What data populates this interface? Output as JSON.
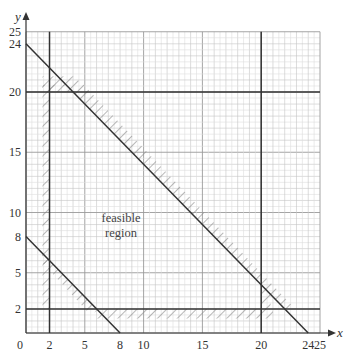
{
  "chart_data": {
    "type": "line",
    "title": "",
    "xlabel": "x",
    "ylabel": "y",
    "xlim": [
      0,
      25
    ],
    "ylim": [
      0,
      25
    ],
    "grid": true,
    "x_ticks": [
      0,
      2,
      5,
      8,
      10,
      15,
      20,
      24,
      25
    ],
    "y_ticks": [
      2,
      5,
      8,
      10,
      15,
      20,
      24,
      25
    ],
    "series": [
      {
        "name": "x + y = 24",
        "points": [
          [
            0,
            24
          ],
          [
            24,
            0
          ]
        ],
        "hatched_side": "above-right"
      },
      {
        "name": "x + y = 8",
        "points": [
          [
            0,
            8
          ],
          [
            8,
            0
          ]
        ],
        "hatched_side": "below-left"
      },
      {
        "name": "x = 2",
        "points": [
          [
            2,
            0
          ],
          [
            2,
            25
          ]
        ],
        "hatched_side": "left"
      },
      {
        "name": "x = 20",
        "points": [
          [
            20,
            0
          ],
          [
            20,
            25
          ]
        ],
        "hatched_side": "right"
      },
      {
        "name": "y = 2",
        "points": [
          [
            0,
            2
          ],
          [
            25,
            2
          ]
        ],
        "hatched_side": "below"
      },
      {
        "name": "y = 20",
        "points": [
          [
            0,
            20
          ],
          [
            25,
            20
          ]
        ],
        "hatched_side": "above"
      }
    ],
    "annotations": [
      {
        "text": "feasible region",
        "x": 8,
        "y": 9
      }
    ]
  },
  "labels": {
    "x_axis": "x",
    "y_axis": "y",
    "origin": "0",
    "region_line1": "feasible",
    "region_line2": "region",
    "x_ticks": [
      "2",
      "5",
      "8",
      "10",
      "15",
      "20",
      "24",
      "25"
    ],
    "y_ticks": [
      "2",
      "5",
      "8",
      "10",
      "15",
      "20",
      "24",
      "25"
    ]
  }
}
